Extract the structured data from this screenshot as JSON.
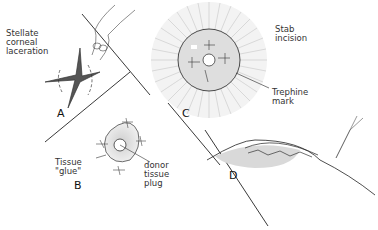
{
  "figure": {
    "panels": [
      {
        "id": "A",
        "label": "A",
        "caption": "Stellate\ncorneal\nlaceration"
      },
      {
        "id": "B",
        "label": "B",
        "captions": [
          "Tissue\n\"glue\"",
          "donor\ntissue\nplug"
        ]
      },
      {
        "id": "C",
        "label": "C",
        "captions": [
          "Stab\nincision",
          "Trephine\nmark"
        ]
      },
      {
        "id": "D",
        "label": "D"
      }
    ],
    "colors": {
      "ink": "#222222",
      "hatch": "#9a9a9a",
      "shade": "#d8d8d8",
      "background": "#ffffff"
    }
  }
}
